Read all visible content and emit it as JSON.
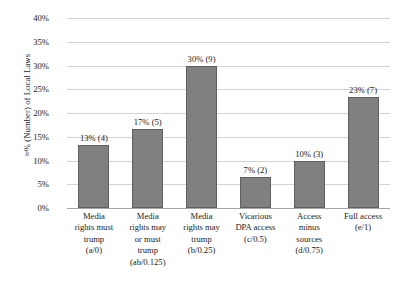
{
  "chart_data": {
    "type": "bar",
    "title": "",
    "xlabel": "",
    "ylabel": "≈% (Number) of Local Laws",
    "ylim": [
      0,
      40
    ],
    "ytick_labels": [
      "40%",
      "35%",
      "30%",
      "25%",
      "20%",
      "15%",
      "10%",
      "5%",
      "0%"
    ],
    "ytick_values": [
      40,
      35,
      30,
      25,
      20,
      15,
      10,
      5,
      0
    ],
    "grid": true,
    "legend": false,
    "bar_color": "#808080",
    "bar_border_color": "#5f5f5f",
    "gridline_color": "#d4d4d4",
    "axis_color": "#a6a6a6",
    "categories": [
      "Media rights must trump (a/0)",
      "Media rights may or must trump (ab/0.125)",
      "Media rights may trump (b/0.25)",
      "Vicarious DPA access (c/0.5)",
      "Access minus sources (d/0.75)",
      "Full access (e/1)"
    ],
    "category_lines": [
      [
        "Media",
        "rights must",
        "trump",
        "(a/0)"
      ],
      [
        "Media",
        "rights may",
        "or must",
        "trump",
        "(ab/0.125)"
      ],
      [
        "Media",
        "rights may",
        "trump",
        "(b/0.25)"
      ],
      [
        "Vicarious",
        "DPA access",
        "(c/0.5)"
      ],
      [
        "Access",
        "minus",
        "sources",
        "(d/0.75)"
      ],
      [
        "Full access",
        "(e/1)"
      ]
    ],
    "values": [
      13.3,
      16.6,
      30,
      6.6,
      10,
      23.3
    ],
    "counts": [
      4,
      5,
      9,
      2,
      3,
      7
    ],
    "data_labels": [
      "13% (4)",
      "17% (5)",
      "30% (9)",
      "7% (2)",
      "10% (3)",
      "23% (7)"
    ]
  }
}
